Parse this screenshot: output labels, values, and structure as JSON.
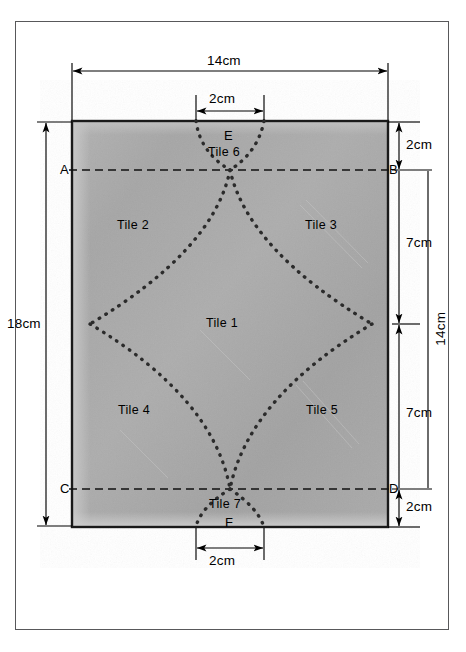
{
  "diagram": {
    "fabric": {
      "fill_color": "#a8a8a8",
      "border_color": "#1a1a1a",
      "width_cm": 14,
      "height_cm": 18
    },
    "stitch_color": "#2b2b2b",
    "frame_color": "#58585a"
  },
  "dimensions": {
    "top_width": "14cm",
    "top_notch": "2cm",
    "left_height": "18cm",
    "right_top": "2cm",
    "right_upper": "7cm",
    "right_lower": "7cm",
    "right_bottom": "2cm",
    "right_total": "14cm",
    "bottom_notch": "2cm"
  },
  "points": {
    "a": "A",
    "b": "B",
    "c": "C",
    "d": "D",
    "e": "E",
    "f": "F"
  },
  "tiles": [
    {
      "label": "Tile 1"
    },
    {
      "label": "Tile 2"
    },
    {
      "label": "Tile 3"
    },
    {
      "label": "Tile 4"
    },
    {
      "label": "Tile 5"
    },
    {
      "label": "Tile 6"
    },
    {
      "label": "Tile 7"
    }
  ]
}
